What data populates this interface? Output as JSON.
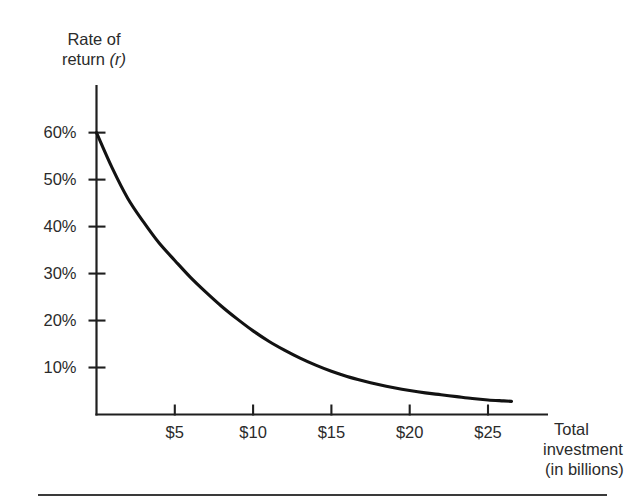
{
  "figure": {
    "name": "investment-demand-curve",
    "background_color": "#ffffff",
    "ink_color": "#1a1a1a"
  },
  "y_axis": {
    "title_line1": "Rate of",
    "title_line2": "return",
    "title_symbol": "(r)",
    "tick_labels": [
      "10%",
      "20%",
      "30%",
      "40%",
      "50%",
      "60%"
    ],
    "tick_values": [
      10,
      20,
      30,
      40,
      50,
      60
    ]
  },
  "x_axis": {
    "title_line1": "Total",
    "title_line2": "investment",
    "title_line3": "(in billions)",
    "tick_labels": [
      "$5",
      "$10",
      "$15",
      "$20",
      "$25"
    ],
    "tick_values": [
      5,
      10,
      15,
      20,
      25
    ]
  },
  "chart_data": {
    "type": "line",
    "title": "",
    "subtitle": "",
    "xlabel": "Total investment (in billions)",
    "ylabel": "Rate of return (r)",
    "xlim": [
      0,
      29
    ],
    "ylim": [
      0,
      67
    ],
    "grid": false,
    "legend": null,
    "x_tick_labels": [
      "$5",
      "$10",
      "$15",
      "$20",
      "$25"
    ],
    "x_ticks": [
      5,
      10,
      15,
      20,
      25
    ],
    "y_tick_labels": [
      "10%",
      "20%",
      "30%",
      "40%",
      "50%",
      "60%"
    ],
    "y_ticks": [
      10,
      20,
      30,
      40,
      50,
      60
    ],
    "series": [
      {
        "name": "Investment demand (rate of return on investment)",
        "x": [
          0,
          1,
          2,
          3,
          4,
          5,
          6,
          7,
          8,
          9,
          10,
          11,
          12,
          13,
          14,
          15,
          16,
          17,
          18,
          19,
          20,
          21,
          22,
          23,
          24,
          25,
          26,
          26.5
        ],
        "values": [
          60,
          52.5,
          46,
          41,
          36.5,
          32.8,
          29.2,
          26,
          23,
          20.3,
          17.8,
          15.6,
          13.7,
          12,
          10.5,
          9.2,
          8.1,
          7.2,
          6.4,
          5.7,
          5.1,
          4.6,
          4.2,
          3.8,
          3.4,
          3.1,
          2.9,
          2.8
        ]
      }
    ],
    "annotations": []
  }
}
